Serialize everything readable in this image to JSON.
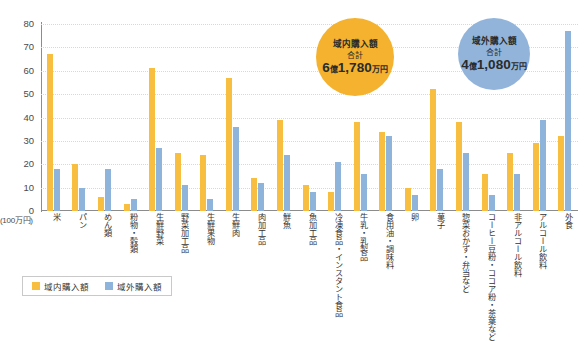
{
  "chart_data": {
    "type": "bar",
    "title": "",
    "xlabel": "",
    "ylabel": "",
    "unit_note": "(100万円)",
    "ylim": [
      0,
      80
    ],
    "yticks": [
      0,
      10,
      20,
      30,
      40,
      50,
      60,
      70,
      80
    ],
    "grid": true,
    "legend_position": "bottom-left",
    "categories": [
      "米",
      "パン",
      "めん類",
      "粉物・穀類",
      "生鮮野菜",
      "野菜加工品",
      "生鮮果物",
      "生鮮肉",
      "肉加工品",
      "鮮魚",
      "魚加工品",
      "冷凍食品・インスタント食品",
      "牛乳・乳製品",
      "食用油・調味料",
      "卵",
      "菓子",
      "惣菜おかず・弁当など",
      "コーヒー豆粉・ココア粉・茶葉など",
      "非アルコール飲料",
      "アルコール飲料",
      "外食"
    ],
    "series": [
      {
        "name": "域内購入額",
        "color": "#F7BE3F",
        "values": [
          67,
          20,
          6,
          3,
          61,
          25,
          24,
          57,
          14,
          39,
          11,
          8,
          38,
          34,
          10,
          52,
          38,
          16,
          25,
          29,
          32
        ]
      },
      {
        "name": "域外購入額",
        "color": "#8FB4DC",
        "values": [
          18,
          10,
          18,
          5,
          27,
          11,
          5,
          36,
          12,
          24,
          8,
          21,
          16,
          32,
          7,
          18,
          25,
          7,
          16,
          39,
          77
        ]
      }
    ]
  },
  "legend": {
    "items": [
      {
        "label": "域内購入額",
        "color": "#F7BE3F"
      },
      {
        "label": "域外購入額",
        "color": "#8FB4DC"
      }
    ]
  },
  "callouts": {
    "inner": {
      "title": "域内購入額",
      "sub": "合計",
      "value_big1": "6",
      "value_unit1": "億",
      "value_big2": "1,780",
      "value_unit2": "万円",
      "color": "#F4B22E"
    },
    "outer": {
      "title": "域外購入額",
      "sub": "合計",
      "value_big1": "4",
      "value_unit1": "億",
      "value_big2": "1,080",
      "value_unit2": "万円",
      "color": "#92B4DA"
    }
  }
}
